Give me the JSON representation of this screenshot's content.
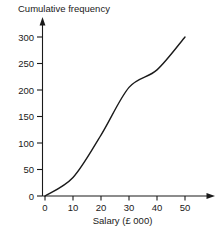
{
  "chart_data": {
    "type": "line",
    "title": "Cumulative frequency",
    "xlabel": "Salary (£ 000)",
    "ylabel": "Cumulative frequency",
    "x": [
      0,
      10,
      20,
      30,
      40,
      50
    ],
    "values": [
      0,
      35,
      115,
      205,
      238,
      300
    ],
    "series": [
      {
        "name": "Cumulative frequency",
        "points": [
          {
            "x": 0,
            "y": 0
          },
          {
            "x": 10,
            "y": 35
          },
          {
            "x": 20,
            "y": 115
          },
          {
            "x": 30,
            "y": 205
          },
          {
            "x": 40,
            "y": 238
          },
          {
            "x": 50,
            "y": 300
          }
        ]
      }
    ],
    "xlim": [
      0,
      50
    ],
    "ylim": [
      0,
      300
    ],
    "xticks": [
      "0",
      "10",
      "20",
      "30",
      "40",
      "50"
    ],
    "yticks": [
      "0",
      "50",
      "100",
      "150",
      "200",
      "250",
      "300"
    ],
    "grid": false,
    "legend": false,
    "line_color": "#1a1a1a",
    "axis_color": "#1a1a1a"
  },
  "axes": {
    "y_tick_labels": [
      "300",
      "250",
      "200",
      "150",
      "100",
      "50",
      "0"
    ],
    "x_tick_labels": [
      "0",
      "10",
      "20",
      "30",
      "40",
      "50"
    ],
    "x_title": "Salary (£ 000)",
    "y_title": "Cumulative frequency"
  }
}
